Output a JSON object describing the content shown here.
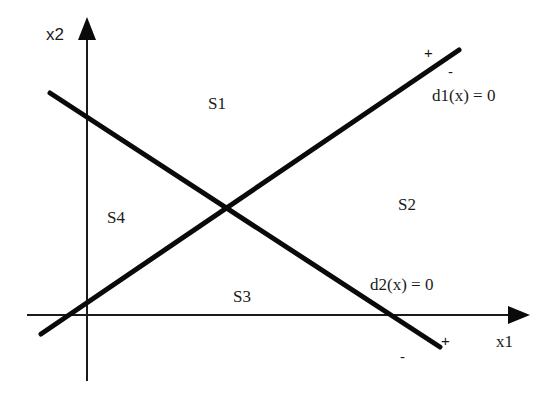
{
  "diagram": {
    "title": "",
    "axes": {
      "x_label": "x1",
      "y_label": "x2"
    },
    "regions": {
      "s1": "S1",
      "s2": "S2",
      "s3": "S3",
      "s4": "S4"
    },
    "boundaries": {
      "d1": {
        "label": "d1(x) = 0",
        "positive_side": "+",
        "negative_side": "-"
      },
      "d2": {
        "label": "d2(x) = 0",
        "positive_side": "+",
        "negative_side": "-"
      }
    },
    "colors": {
      "line": "#0a0a0a",
      "axis": "#1a1a1a",
      "background": "#ffffff"
    }
  }
}
